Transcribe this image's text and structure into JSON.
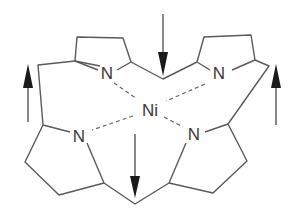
{
  "diagram": {
    "metal_label": "Ni",
    "nitrogen_labels": [
      "N",
      "N",
      "N",
      "N"
    ],
    "colors": {
      "bond": "#5a5a5a",
      "coordination": "#6a6a6a",
      "arrow": "#1a1a1a",
      "text": "#3a3a3a",
      "background": "#ffffff"
    },
    "arrows": [
      {
        "name": "top-center-arrow",
        "direction": "down"
      },
      {
        "name": "bottom-center-arrow",
        "direction": "down"
      },
      {
        "name": "left-arrow",
        "direction": "up"
      },
      {
        "name": "right-arrow",
        "direction": "up"
      }
    ]
  }
}
